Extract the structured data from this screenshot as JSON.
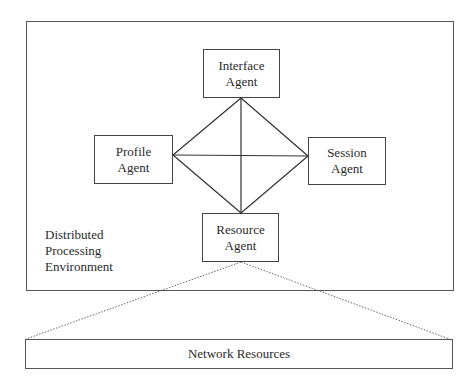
{
  "diagram": {
    "environment": {
      "label_lines": [
        "Distributed",
        "Processing",
        "Environment"
      ]
    },
    "agents": {
      "interface": {
        "line1": "Interface",
        "line2": "Agent"
      },
      "profile": {
        "line1": "Profile",
        "line2": "Agent"
      },
      "session": {
        "line1": "Session",
        "line2": "Agent"
      },
      "resource": {
        "line1": "Resource",
        "line2": "Agent"
      }
    },
    "network": {
      "label": "Network Resources"
    },
    "connections": [
      {
        "from": "Interface Agent",
        "to": "Profile Agent",
        "style": "solid"
      },
      {
        "from": "Interface Agent",
        "to": "Session Agent",
        "style": "solid"
      },
      {
        "from": "Interface Agent",
        "to": "Resource Agent",
        "style": "solid"
      },
      {
        "from": "Profile Agent",
        "to": "Session Agent",
        "style": "solid"
      },
      {
        "from": "Profile Agent",
        "to": "Resource Agent",
        "style": "solid"
      },
      {
        "from": "Session Agent",
        "to": "Resource Agent",
        "style": "solid"
      },
      {
        "from": "Resource Agent",
        "to": "Network Resources",
        "style": "dotted"
      }
    ]
  }
}
